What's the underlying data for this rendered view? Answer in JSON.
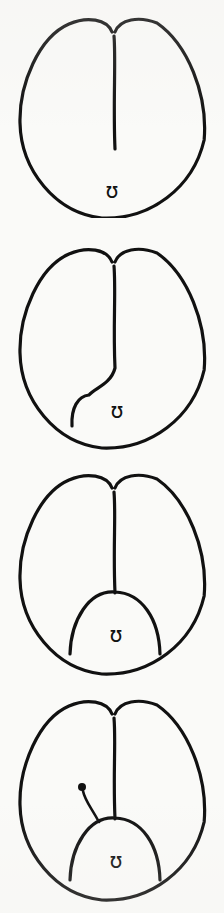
{
  "figure": {
    "panel_count": 4,
    "background_color": "#fafaf8",
    "ink_color": "#111111",
    "stroke_width": 3.2,
    "canvas": {
      "width": 224,
      "height": 913
    }
  },
  "glyph": {
    "symbol": "ʊ",
    "name": "upsilon-marker",
    "description": "small latin upsilon marker placed at the ventral pole of each stage"
  },
  "panels": [
    {
      "id": "stage-1",
      "label": "stage-1",
      "top": 6,
      "height": 212,
      "body": {
        "center_x": 113,
        "center_y": 112,
        "radius_x": 93,
        "radius_y": 100,
        "apex_notch_depth": 14
      },
      "furrow": {
        "kind": "straight",
        "start_x": 114,
        "start_y": 30,
        "end_x": 115,
        "end_y": 143,
        "description": "median furrow descends from apical notch to mid-body"
      },
      "dome": null,
      "marker_dot": null,
      "glyph_position": {
        "x": 112,
        "y": 192
      }
    },
    {
      "id": "stage-2",
      "label": "stage-2",
      "top": 236,
      "height": 216,
      "body": {
        "center_x": 113,
        "center_y": 112,
        "radius_x": 93,
        "radius_y": 100,
        "apex_notch_depth": 14
      },
      "furrow": {
        "kind": "hooked",
        "start_x": 114,
        "start_y": 30,
        "end_x": 115,
        "end_y": 132,
        "hook_end_x": 72,
        "hook_end_y": 190,
        "description": "median furrow deviates left at its base and curves down to the ventral rim"
      },
      "dome": null,
      "marker_dot": null,
      "glyph_position": {
        "x": 117,
        "y": 182
      }
    },
    {
      "id": "stage-3",
      "label": "stage-3",
      "top": 462,
      "height": 218,
      "body": {
        "center_x": 113,
        "center_y": 112,
        "radius_x": 93,
        "radius_y": 100,
        "apex_notch_depth": 14
      },
      "furrow": {
        "kind": "straight",
        "start_x": 114,
        "start_y": 30,
        "end_x": 115,
        "end_y": 131,
        "description": "median furrow descends to the crest of the ventral dome"
      },
      "dome": {
        "left_x": 70,
        "right_x": 160,
        "base_y": 192,
        "apex_x": 115,
        "apex_y": 130,
        "description": "symmetric ventral dome partitioned off at the base"
      },
      "marker_dot": null,
      "glyph_position": {
        "x": 116,
        "y": 180
      }
    },
    {
      "id": "stage-4",
      "label": "stage-4",
      "top": 688,
      "height": 220,
      "body": {
        "center_x": 113,
        "center_y": 112,
        "radius_x": 93,
        "radius_y": 100,
        "apex_notch_depth": 14
      },
      "furrow": {
        "kind": "straight",
        "start_x": 114,
        "start_y": 30,
        "end_x": 115,
        "end_y": 131,
        "description": "median furrow descends to the crest of the ventral dome"
      },
      "dome": {
        "left_x": 70,
        "right_x": 160,
        "base_y": 192,
        "apex_x": 115,
        "apex_y": 130,
        "description": "symmetric ventral dome partitioned off at the base"
      },
      "marker_dot": {
        "x": 82,
        "y": 99,
        "radius": 4,
        "tail_end_x": 99,
        "tail_end_y": 134,
        "description": "filled knob with curved stalk arising from the left flank of the dome"
      },
      "glyph_position": {
        "x": 116,
        "y": 180
      }
    }
  ]
}
